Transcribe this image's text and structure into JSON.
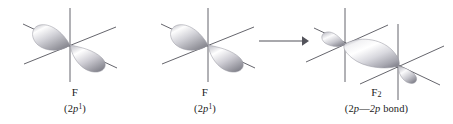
{
  "figure": {
    "background_color": "#ffffff",
    "line_color": "#4a4a52",
    "text_color": "#1b1b1b",
    "orbital_fill_light": "#ffffff",
    "orbital_fill_mid": "#c9c9cf",
    "orbital_fill_dark": "#8e8e98"
  },
  "panels": [
    {
      "id": "left",
      "name": "fluorine-atom-left",
      "symbol": "F",
      "symbol_subscript": "",
      "config_prefix": "(2",
      "config_orbital": "p",
      "config_superscript": "1",
      "config_suffix": ")",
      "config_full": "(2p¹)",
      "axes": 3,
      "lobes": 2
    },
    {
      "id": "middle",
      "name": "fluorine-atom-middle",
      "symbol": "F",
      "symbol_subscript": "",
      "config_prefix": "(2",
      "config_orbital": "p",
      "config_superscript": "1",
      "config_suffix": ")",
      "config_full": "(2p¹)",
      "axes": 3,
      "lobes": 2
    },
    {
      "id": "right",
      "name": "fluorine-molecule",
      "symbol": "F",
      "symbol_subscript": "2",
      "config_prefix": "(2",
      "config_orbital": "p",
      "config_dash": "—",
      "config_orbital2": "2p",
      "config_word": " bond",
      "config_suffix": ")",
      "config_full": "(2p—2p bond)",
      "axes": 6,
      "lobes": 3
    }
  ],
  "arrow": {
    "name": "reaction-arrow",
    "direction": "right",
    "glyph": "→"
  }
}
